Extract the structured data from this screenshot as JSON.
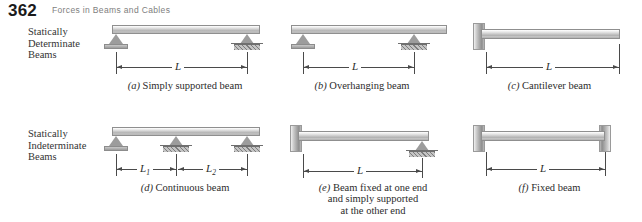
{
  "header": {
    "page_number": "362",
    "running_head": "Forces in Beams and Cables"
  },
  "row_labels": {
    "determinate": {
      "line1": "Statically",
      "line2": "Determinate",
      "line3": "Beams"
    },
    "indeterminate": {
      "line1": "Statically",
      "line2": "Indeterminate",
      "line3": "Beams"
    }
  },
  "figures": [
    {
      "key": "a",
      "tag": "(a)",
      "caption": "Simply supported beam",
      "dimensions": [
        {
          "label": "L",
          "sub": ""
        }
      ]
    },
    {
      "key": "b",
      "tag": "(b)",
      "caption": "Overhanging beam",
      "dimensions": [
        {
          "label": "L",
          "sub": ""
        }
      ]
    },
    {
      "key": "c",
      "tag": "(c)",
      "caption": "Cantilever beam",
      "dimensions": [
        {
          "label": "L",
          "sub": ""
        }
      ]
    },
    {
      "key": "d",
      "tag": "(d)",
      "caption": "Continuous beam",
      "dimensions": [
        {
          "label": "L",
          "sub": "1"
        },
        {
          "label": "L",
          "sub": "2"
        }
      ]
    },
    {
      "key": "e",
      "tag": "(e)",
      "caption_line1": "Beam fixed at one end",
      "caption_line2": "and simply supported",
      "caption_line3": "at the other end",
      "dimensions": [
        {
          "label": "L",
          "sub": ""
        }
      ]
    },
    {
      "key": "f",
      "tag": "(f)",
      "caption": "Fixed beam",
      "dimensions": [
        {
          "label": "L",
          "sub": ""
        }
      ]
    }
  ],
  "colors": {
    "page_background": "#ffffff",
    "beam_light": "#f4f4f4",
    "beam_dark": "#9f9f9f",
    "support_grey": "#9c9c9c",
    "wall_grey": "#a8a8a8",
    "dimension_line": "#4a4a4a",
    "running_head_text": "#7e7e7e",
    "body_text": "#2b2b2b"
  }
}
